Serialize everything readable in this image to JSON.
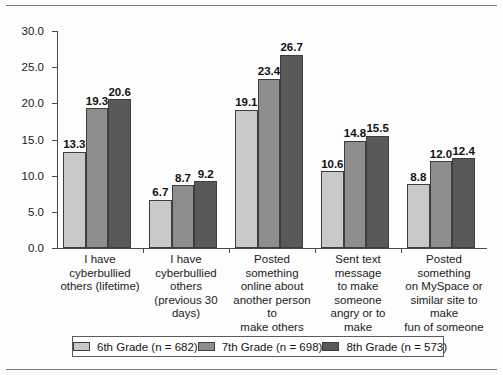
{
  "chart_data": {
    "type": "bar",
    "title": "",
    "xlabel": "",
    "ylabel": "",
    "ylim": [
      0,
      30
    ],
    "ytick_labels": [
      "0.0",
      "5.0",
      "10.0",
      "15.0",
      "20.0",
      "25.0",
      "30.0"
    ],
    "ytick_values": [
      0,
      5,
      10,
      15,
      20,
      25,
      30
    ],
    "grid": false,
    "legend_position": "bottom",
    "categories": [
      "I have cyberbullied others (lifetime)",
      "I have cyberbullied others (previous 30 days)",
      "Posted something online about another person to make others laugh",
      "Sent text message to make someone angry or to make fun of them",
      "Posted something on MySpace or similar site to make fun of someone"
    ],
    "category_lines": [
      [
        "I have",
        "cyberbullied",
        "others (lifetime)"
      ],
      [
        "I have cyberbullied",
        "others",
        "(previous 30 days)"
      ],
      [
        "Posted",
        "something",
        "online about",
        "another person to",
        "make others laugh"
      ],
      [
        "Sent text message",
        "to make someone",
        "angry or to make",
        "fun of them"
      ],
      [
        "Posted",
        "something",
        "on MySpace or",
        "similar site to make",
        "fun of someone"
      ]
    ],
    "series": [
      {
        "name": "6th Grade (n = 682)",
        "color": "#c9c9c9",
        "values": [
          13.3,
          6.7,
          19.1,
          10.6,
          8.8
        ]
      },
      {
        "name": "7th Grade (n = 698)",
        "color": "#8d8d8d",
        "values": [
          19.3,
          8.7,
          23.4,
          14.8,
          12.0
        ]
      },
      {
        "name": "8th Grade (n = 573)",
        "color": "#595959",
        "values": [
          20.6,
          9.2,
          26.7,
          15.5,
          12.4
        ]
      }
    ]
  },
  "legend": {
    "items": [
      {
        "label": "6th Grade (n = 682)",
        "color": "#c9c9c9"
      },
      {
        "label": "7th Grade (n = 698)",
        "color": "#8d8d8d"
      },
      {
        "label": "8th Grade (n = 573)",
        "color": "#595959"
      }
    ]
  }
}
